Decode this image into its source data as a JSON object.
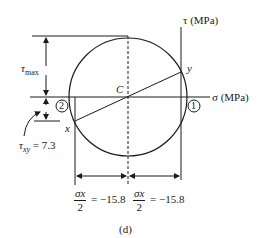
{
  "diagram": {
    "axes": {
      "tau_label": "τ (MPa)",
      "sigma_label": "σ (MPa)"
    },
    "points": {
      "center": "C",
      "x": "x",
      "y": "y",
      "point_1": "1",
      "point_2": "2"
    },
    "annotations": {
      "tau_max_symbol": "τ",
      "tau_max_sub": "max",
      "tau_xy_symbol": "τ",
      "tau_xy_sub": "xy",
      "tau_xy_value": " = 7.3",
      "left_dim_num": "σx",
      "left_dim_den": "2",
      "left_dim_value": "= −15.8",
      "right_dim_num": "σx",
      "right_dim_den": "2",
      "right_dim_value": "= −15.8"
    },
    "caption": "(d)",
    "colors": {
      "line": "#1a1a1a",
      "background": "#ffffff"
    }
  }
}
